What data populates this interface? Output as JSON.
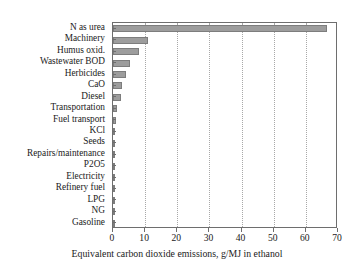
{
  "chart_data": {
    "type": "bar",
    "orientation": "horizontal",
    "title": "",
    "xlabel": "Equivalent carbon dioxide emissions, g/MJ in ethanol",
    "ylabel": "",
    "xlim": [
      0,
      70
    ],
    "xticks": [
      0,
      10,
      20,
      30,
      40,
      50,
      60,
      70
    ],
    "xticklabels": [
      "0",
      "10",
      "20",
      "30",
      "40",
      "50",
      "60",
      "70"
    ],
    "grid": "vertical-dotted",
    "legend": "none",
    "bar_color": "#9d9d9d",
    "bar_edge_color": "#7d7d7d",
    "axis_color": "#6e6e6e",
    "categories": [
      "N as urea",
      "Machinery",
      "Humus oxid.",
      "Wastewater BOD",
      "Herbicides",
      "CaO",
      "Diesel",
      "Transportation",
      "Fuel transport",
      "KCl",
      "Seeds",
      "Repairs/maintenance",
      "P2O5",
      "Electricity",
      "Refinery fuel",
      "LPG",
      "NG",
      "Gasoline"
    ],
    "values": [
      66.5,
      10.8,
      8.0,
      5.3,
      3.9,
      2.7,
      2.4,
      1.3,
      0.8,
      0.4,
      0.2,
      0.2,
      0.1,
      0.1,
      0.05,
      0.05,
      0.05,
      0.05
    ]
  }
}
